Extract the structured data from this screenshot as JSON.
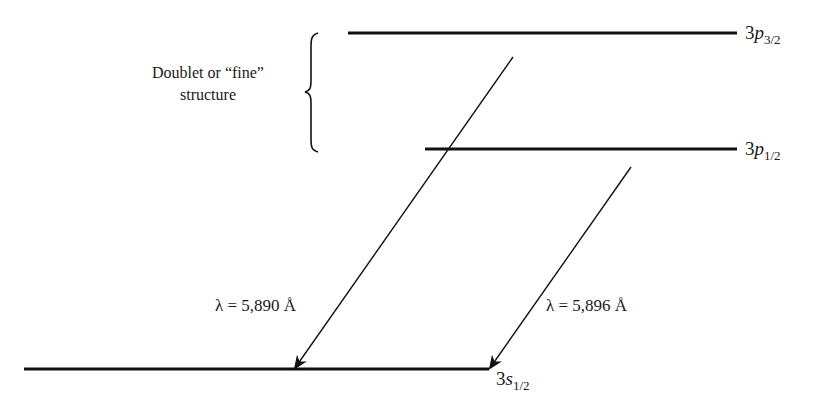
{
  "annotation": {
    "line1": "Doublet or “fine”",
    "line2": "structure"
  },
  "levels": [
    {
      "id": "3p32",
      "prefix": "3",
      "orbital": "p",
      "subscript": "3/2",
      "x1": 348,
      "x2": 737,
      "y": 33
    },
    {
      "id": "3p12",
      "prefix": "3",
      "orbital": "p",
      "subscript": "1/2",
      "x1": 425,
      "x2": 737,
      "y": 149
    },
    {
      "id": "3s12",
      "prefix": "3",
      "orbital": "s",
      "subscript": "1/2",
      "x1": 24,
      "x2": 489,
      "y": 369
    }
  ],
  "transitions": [
    {
      "from": "3p3/2",
      "to": "3s1/2",
      "label": "λ = 5,890 Å",
      "x1": 513,
      "y1": 57,
      "x2": 295,
      "y2": 369
    },
    {
      "from": "3p1/2",
      "to": "3s1/2",
      "label": "λ = 5,896 Å",
      "x1": 631,
      "y1": 167,
      "x2": 490,
      "y2": 369
    }
  ],
  "colors": {
    "line": "#111111",
    "background": "#ffffff"
  }
}
